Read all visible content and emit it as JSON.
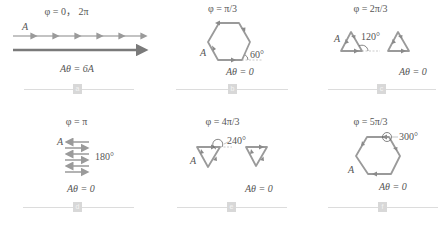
{
  "figure": {
    "colors": {
      "vector": "#9a9a9a",
      "resultant": "#7a7a7a",
      "text": "#555555",
      "divider": "#dcdcdc",
      "badge": "#d8d8d8"
    },
    "panels": [
      {
        "id": "a",
        "phase": "φ = 0， 2π",
        "vector_label": "A",
        "angle_label": "",
        "result": "Aθ = 6A",
        "badge": "a"
      },
      {
        "id": "b",
        "phase": "φ = π/3",
        "vector_label": "A",
        "angle_label": "60°",
        "result": "Aθ = 0",
        "badge": "b"
      },
      {
        "id": "c",
        "phase": "φ = 2π/3",
        "vector_label": "A",
        "angle_label": "120°",
        "result": "Aθ = 0",
        "badge": "c"
      },
      {
        "id": "d",
        "phase": "φ = π",
        "vector_label": "A",
        "angle_label": "180°",
        "result": "Aθ = 0",
        "badge": "d"
      },
      {
        "id": "e",
        "phase": "φ = 4π/3",
        "vector_label": "A",
        "angle_label": "240°",
        "result": "Aθ = 0",
        "badge": "e"
      },
      {
        "id": "f",
        "phase": "φ = 5π/3",
        "vector_label": "A",
        "angle_label": "300°",
        "result": "Aθ = 0",
        "badge": "f"
      }
    ]
  }
}
